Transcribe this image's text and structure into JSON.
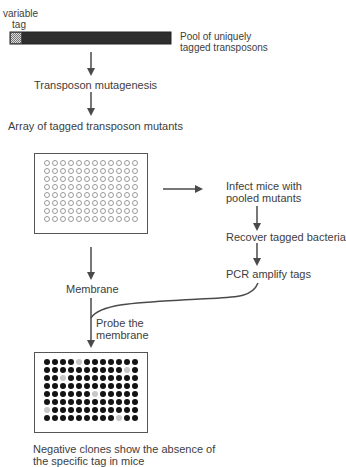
{
  "diagram": {
    "labels": {
      "variable_tag": [
        "variable",
        "tag"
      ],
      "pool": [
        "Pool of uniquely",
        "tagged transposons"
      ],
      "mutagenesis": "Transposon mutagenesis",
      "array": "Array of tagged transposon mutants",
      "infect": [
        "Infect mice with",
        "pooled mutants"
      ],
      "recover": "Recover tagged bacteria",
      "pcr": "PCR amplify tags",
      "membrane": "Membrane",
      "probe": [
        "Probe the",
        "membrane"
      ],
      "conclusion": [
        "Negative clones show the absence of",
        "the specific tag in mice"
      ]
    },
    "plates": {
      "rows": 8,
      "cols": 12,
      "master_plate_state": "empty",
      "probed_membrane_negatives": [
        [
          0,
          4
        ],
        [
          1,
          10
        ],
        [
          2,
          2
        ],
        [
          4,
          6
        ],
        [
          6,
          0
        ],
        [
          7,
          9
        ]
      ]
    },
    "colors": {
      "line": "#4a4a4a",
      "positive": "#141414",
      "negative": "#c8c8c8",
      "tag_bar": "#2e2e2e"
    }
  }
}
